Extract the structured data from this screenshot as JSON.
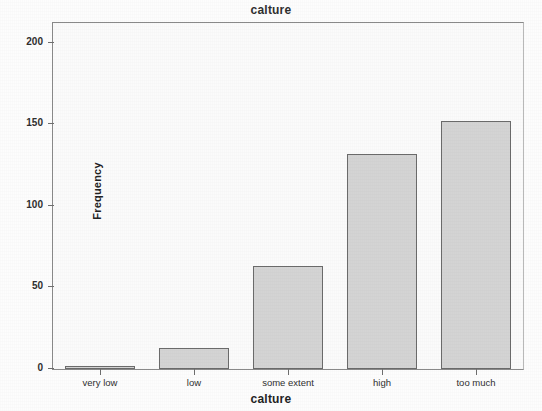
{
  "chart_data": {
    "type": "bar",
    "title": "calture",
    "xlabel": "calture",
    "ylabel": "Frequency",
    "categories": [
      "very low",
      "low",
      "some extent",
      "high",
      "too much"
    ],
    "values": [
      2,
      13,
      63,
      132,
      152
    ],
    "ylim": [
      0,
      212
    ],
    "yticks": [
      0,
      50,
      100,
      150,
      200
    ],
    "ytick_labels": [
      "0",
      "50",
      "100",
      "150",
      "200"
    ],
    "grid": false,
    "legend": null,
    "bar_fill_color": "#d4d4d4",
    "bar_border_color": "#6b6b6b",
    "plot_background_color": "#fbfbfb",
    "axis_color": "#8a8a8a"
  }
}
